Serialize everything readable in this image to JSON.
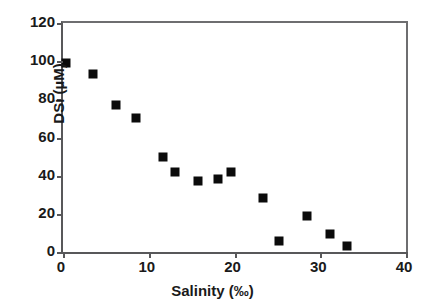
{
  "chart_data": {
    "type": "scatter",
    "title": "",
    "xlabel": "Salinity (‰)",
    "ylabel": "DSi (µM)",
    "xlim": [
      0,
      40
    ],
    "ylim": [
      0,
      120
    ],
    "xticks": [
      0,
      10,
      20,
      30,
      40
    ],
    "yticks": [
      0,
      20,
      40,
      60,
      80,
      100,
      120
    ],
    "xtick_labels": [
      "0",
      "10",
      "20",
      "30",
      "40"
    ],
    "ytick_labels": [
      "0",
      "20",
      "40",
      "60",
      "80",
      "100",
      "120"
    ],
    "grid": false,
    "legend": null,
    "marker": {
      "shape": "square",
      "color": "#0b0b0b",
      "size_px": 9
    },
    "series": [
      {
        "name": "DSi vs Salinity",
        "points": [
          {
            "x": 0.3,
            "y": 99
          },
          {
            "x": 3.5,
            "y": 93.5
          },
          {
            "x": 6.2,
            "y": 77
          },
          {
            "x": 8.5,
            "y": 70
          },
          {
            "x": 11.7,
            "y": 50
          },
          {
            "x": 13.1,
            "y": 42
          },
          {
            "x": 15.7,
            "y": 37
          },
          {
            "x": 18.1,
            "y": 38.5
          },
          {
            "x": 19.6,
            "y": 42
          },
          {
            "x": 23.3,
            "y": 28.5
          },
          {
            "x": 25.2,
            "y": 6
          },
          {
            "x": 28.4,
            "y": 19
          },
          {
            "x": 31.1,
            "y": 9.5
          },
          {
            "x": 33.1,
            "y": 3
          }
        ]
      }
    ]
  },
  "axes": {
    "frame_color": "#58585a",
    "tick_color": "#58585a",
    "text_color": "#1a1a1a",
    "background": "#ffffff"
  }
}
